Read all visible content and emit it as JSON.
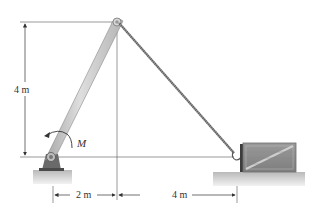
{
  "figure": {
    "type": "statics-problem-diagram"
  },
  "labels": {
    "height_dim": "4 m",
    "moment": "M",
    "horiz_dim_left": "2 m",
    "horiz_dim_right": "4 m"
  },
  "colors": {
    "boom_fill": "#c8c8c8",
    "boom_edge": "#8a8a8a",
    "rope": "#7a7a7a",
    "ground": "#d2d2d2",
    "crate": "#8c8c8c",
    "dim_line": "#333333"
  },
  "geometry": {
    "boom_base": [
      51,
      157
    ],
    "boom_tip": [
      117,
      22
    ],
    "crate_hook": [
      236,
      157
    ],
    "crate_box": [
      243,
      143,
      53,
      29
    ]
  }
}
